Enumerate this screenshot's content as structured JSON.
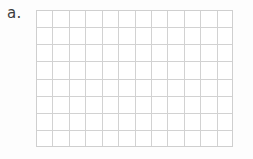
{
  "page": {
    "background_color": "#fdfdfd",
    "width": 253,
    "height": 159
  },
  "problem": {
    "label": "a.",
    "label_color": "#3c3c3c"
  },
  "grid": {
    "name": "blank-answer-grid",
    "columns": 12,
    "rows": 8,
    "cell_count": 96,
    "x": 36,
    "y": 10,
    "width": 197,
    "height": 137,
    "cell_width": 16.42,
    "cell_height": 17.13,
    "line_color": "#d2d2d2",
    "border_color": "#cfcfcf",
    "fill_color": "#ffffff",
    "filled_cells": [],
    "cell_labels": []
  }
}
